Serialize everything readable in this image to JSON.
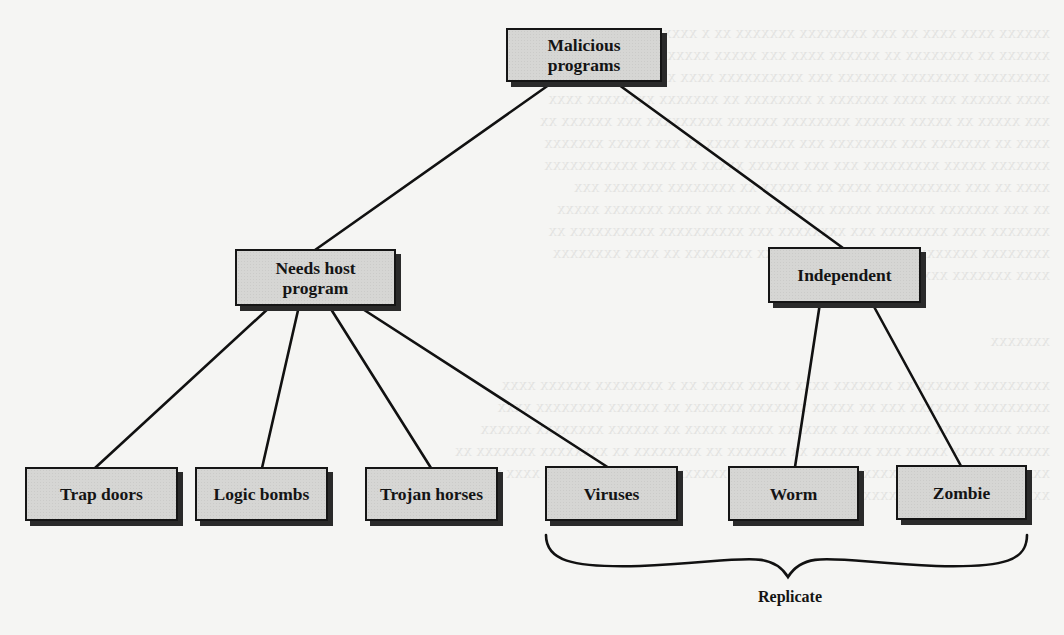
{
  "diagram": {
    "type": "taxonomy-tree",
    "root": {
      "id": "malicious",
      "label_line1": "Malicious",
      "label_line2": "programs"
    },
    "branches": [
      {
        "id": "needs_host",
        "label_line1": "Needs host",
        "label_line2": "program",
        "children": [
          {
            "id": "trap_doors",
            "label": "Trap doors"
          },
          {
            "id": "logic_bombs",
            "label": "Logic bombs"
          },
          {
            "id": "trojan_horses",
            "label": "Trojan horses"
          },
          {
            "id": "viruses",
            "label": "Viruses"
          }
        ]
      },
      {
        "id": "independent",
        "label": "Independent",
        "children": [
          {
            "id": "worm",
            "label": "Worm"
          },
          {
            "id": "zombie",
            "label": "Zombie"
          }
        ]
      }
    ],
    "grouping": {
      "label": "Replicate",
      "members": [
        "Viruses",
        "Worm",
        "Zombie"
      ]
    },
    "edges": [
      [
        "Malicious programs",
        "Needs host program"
      ],
      [
        "Malicious programs",
        "Independent"
      ],
      [
        "Needs host program",
        "Trap doors"
      ],
      [
        "Needs host program",
        "Logic bombs"
      ],
      [
        "Needs host program",
        "Trojan horses"
      ],
      [
        "Needs host program",
        "Viruses"
      ],
      [
        "Independent",
        "Worm"
      ],
      [
        "Independent",
        "Zombie"
      ]
    ],
    "colors": {
      "box_fill": "#d6d6d4",
      "box_border": "#151515",
      "line": "#111111",
      "background": "#f5f5f3"
    }
  }
}
